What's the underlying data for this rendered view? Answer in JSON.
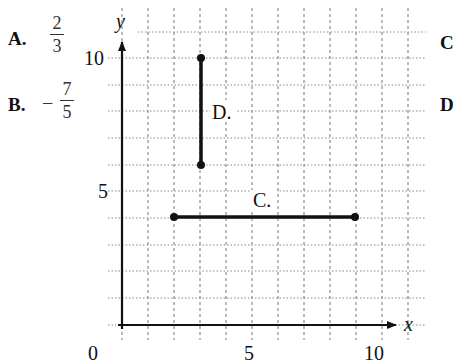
{
  "choices": [
    {
      "letter": "A.",
      "sign": "",
      "numerator": "2",
      "denominator": "3"
    },
    {
      "letter": "B.",
      "sign": "−",
      "numerator": "7",
      "denominator": "5"
    },
    {
      "letter": "C",
      "partial": true
    },
    {
      "letter": "D",
      "partial": true
    }
  ],
  "graph": {
    "x_axis_label": "x",
    "y_axis_label": "y",
    "origin_label": "0",
    "x_tick_labels": [
      "5",
      "10"
    ],
    "y_tick_labels": [
      "5",
      "10"
    ],
    "segments": [
      {
        "label": "C.",
        "from": [
          2,
          4
        ],
        "to": [
          9,
          4
        ]
      },
      {
        "label": "D.",
        "from": [
          3,
          10
        ],
        "to": [
          3,
          6
        ]
      }
    ],
    "grid": {
      "x_range": [
        0,
        11
      ],
      "y_range": [
        0,
        11
      ],
      "step": 1,
      "style": "dotted"
    },
    "colors": {
      "axis": "#111111",
      "grid": "#777777",
      "segment": "#111111"
    }
  }
}
